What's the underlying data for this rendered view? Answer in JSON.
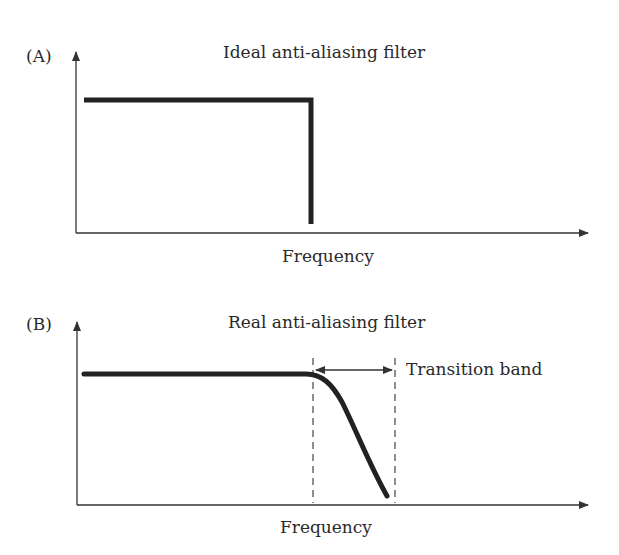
{
  "panels": [
    {
      "label": "(A)",
      "title": "Ideal anti-aliasing filter",
      "xlabel": "Frequency"
    },
    {
      "label": "(B)",
      "title": "Real anti-aliasing filter",
      "xlabel": "Frequency",
      "annotation": "Transition band"
    }
  ],
  "colors": {
    "curve": "#222222",
    "axis": "#333333",
    "text": "#2a2a2a"
  }
}
